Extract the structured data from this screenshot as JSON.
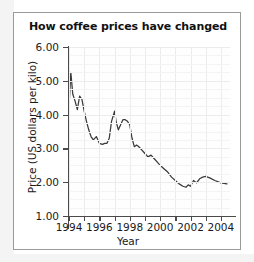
{
  "figure": {
    "title": "How coffee prices have changed"
  },
  "chart_data": {
    "type": "line",
    "title": "How coffee prices have changed",
    "xlabel": "Year",
    "ylabel": "Price (US dollars per kilo)",
    "xlim": [
      1994,
      2004.6
    ],
    "ylim": [
      1.0,
      6.0
    ],
    "grid": true,
    "legend": null,
    "y_ticks": [
      "6.00",
      "5.00",
      "4.00",
      "3.00",
      "2.00",
      "1.00"
    ],
    "y_tick_values": [
      6.0,
      5.0,
      4.0,
      3.0,
      2.0,
      1.0
    ],
    "x_ticks": [
      "1994",
      "1996",
      "1998",
      "2000",
      "2002",
      "2004"
    ],
    "x_tick_values": [
      1994,
      1996,
      1998,
      2000,
      2002,
      2004
    ],
    "x_minor_tick_values": [
      1995,
      1997,
      1999,
      2001,
      2003
    ],
    "series": [
      {
        "name": "Coffee price",
        "color": "#3a3a3a",
        "x": [
          1994.0,
          1994.12,
          1994.25,
          1994.4,
          1994.55,
          1994.7,
          1994.85,
          1995.0,
          1995.15,
          1995.3,
          1995.45,
          1995.6,
          1995.8,
          1996.0,
          1996.2,
          1996.35,
          1996.5,
          1996.65,
          1996.8,
          1997.0,
          1997.1,
          1997.25,
          1997.4,
          1997.55,
          1997.7,
          1997.85,
          1998.0,
          1998.15,
          1998.3,
          1998.45,
          1998.6,
          1998.8,
          1999.0,
          1999.2,
          1999.4,
          1999.6,
          1999.8,
          2000.0,
          2000.25,
          2000.5,
          2000.75,
          2001.0,
          2001.25,
          2001.5,
          2001.7,
          2001.85,
          2002.0,
          2002.2,
          2002.4,
          2002.6,
          2002.8,
          2003.0,
          2003.3,
          2003.6,
          2004.0,
          2004.4
        ],
        "y": [
          4.2,
          5.25,
          4.6,
          4.4,
          4.15,
          4.55,
          4.45,
          4.1,
          3.8,
          3.55,
          3.35,
          3.25,
          3.35,
          3.15,
          3.12,
          3.15,
          3.15,
          3.3,
          3.8,
          4.1,
          3.8,
          3.55,
          3.7,
          3.85,
          3.85,
          3.8,
          3.7,
          3.3,
          3.05,
          3.1,
          3.05,
          2.95,
          2.85,
          2.75,
          2.8,
          2.7,
          2.6,
          2.5,
          2.4,
          2.3,
          2.15,
          2.05,
          1.95,
          1.88,
          1.85,
          1.92,
          1.88,
          2.05,
          1.98,
          2.1,
          2.15,
          2.17,
          2.12,
          2.05,
          1.98,
          1.95
        ]
      }
    ]
  }
}
